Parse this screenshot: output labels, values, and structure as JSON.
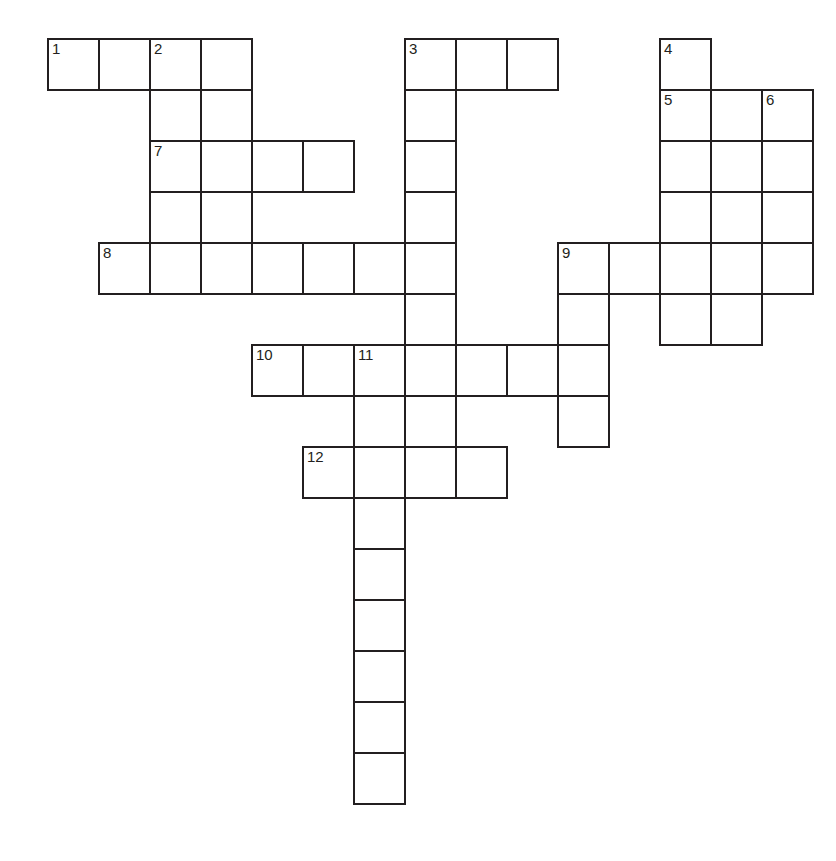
{
  "puzzle": {
    "kind": "crossword-grid",
    "title": "Crossword Puzzle Grid",
    "background_color": "#ffffff",
    "line_color": "#231f20",
    "cell_size": 51,
    "border_width": 2,
    "origin_x": 47,
    "origin_y": 38,
    "columns": 15,
    "rows": 15,
    "total_cells": 58,
    "number_count": 12
  },
  "numbers": [
    {
      "label": "1",
      "col": 0,
      "row": 0
    },
    {
      "label": "2",
      "col": 2,
      "row": 0
    },
    {
      "label": "3",
      "col": 7,
      "row": 0
    },
    {
      "label": "4",
      "col": 12,
      "row": 0
    },
    {
      "label": "5",
      "col": 12,
      "row": 1
    },
    {
      "label": "6",
      "col": 14,
      "row": 1
    },
    {
      "label": "7",
      "col": 2,
      "row": 2
    },
    {
      "label": "8",
      "col": 1,
      "row": 4
    },
    {
      "label": "9",
      "col": 10,
      "row": 4
    },
    {
      "label": "10",
      "col": 4,
      "row": 6
    },
    {
      "label": "11",
      "col": 6,
      "row": 6
    },
    {
      "label": "12",
      "col": 5,
      "row": 8
    }
  ],
  "cells": [
    {
      "col": 0,
      "row": 0,
      "num": "1"
    },
    {
      "col": 1,
      "row": 0,
      "num": ""
    },
    {
      "col": 2,
      "row": 0,
      "num": "2"
    },
    {
      "col": 3,
      "row": 0,
      "num": ""
    },
    {
      "col": 7,
      "row": 0,
      "num": "3"
    },
    {
      "col": 8,
      "row": 0,
      "num": ""
    },
    {
      "col": 9,
      "row": 0,
      "num": ""
    },
    {
      "col": 12,
      "row": 0,
      "num": "4"
    },
    {
      "col": 2,
      "row": 1,
      "num": ""
    },
    {
      "col": 3,
      "row": 1,
      "num": ""
    },
    {
      "col": 7,
      "row": 1,
      "num": ""
    },
    {
      "col": 12,
      "row": 1,
      "num": "5"
    },
    {
      "col": 13,
      "row": 1,
      "num": ""
    },
    {
      "col": 14,
      "row": 1,
      "num": "6"
    },
    {
      "col": 2,
      "row": 2,
      "num": "7"
    },
    {
      "col": 3,
      "row": 2,
      "num": ""
    },
    {
      "col": 4,
      "row": 2,
      "num": ""
    },
    {
      "col": 5,
      "row": 2,
      "num": ""
    },
    {
      "col": 7,
      "row": 2,
      "num": ""
    },
    {
      "col": 12,
      "row": 2,
      "num": ""
    },
    {
      "col": 13,
      "row": 2,
      "num": ""
    },
    {
      "col": 14,
      "row": 2,
      "num": ""
    },
    {
      "col": 2,
      "row": 3,
      "num": ""
    },
    {
      "col": 3,
      "row": 3,
      "num": ""
    },
    {
      "col": 7,
      "row": 3,
      "num": ""
    },
    {
      "col": 12,
      "row": 3,
      "num": ""
    },
    {
      "col": 13,
      "row": 3,
      "num": ""
    },
    {
      "col": 14,
      "row": 3,
      "num": ""
    },
    {
      "col": 1,
      "row": 4,
      "num": "8"
    },
    {
      "col": 2,
      "row": 4,
      "num": ""
    },
    {
      "col": 3,
      "row": 4,
      "num": ""
    },
    {
      "col": 4,
      "row": 4,
      "num": ""
    },
    {
      "col": 5,
      "row": 4,
      "num": ""
    },
    {
      "col": 6,
      "row": 4,
      "num": ""
    },
    {
      "col": 7,
      "row": 4,
      "num": ""
    },
    {
      "col": 10,
      "row": 4,
      "num": "9"
    },
    {
      "col": 11,
      "row": 4,
      "num": ""
    },
    {
      "col": 12,
      "row": 4,
      "num": ""
    },
    {
      "col": 13,
      "row": 4,
      "num": ""
    },
    {
      "col": 14,
      "row": 4,
      "num": ""
    },
    {
      "col": 7,
      "row": 5,
      "num": ""
    },
    {
      "col": 10,
      "row": 5,
      "num": ""
    },
    {
      "col": 12,
      "row": 5,
      "num": ""
    },
    {
      "col": 13,
      "row": 5,
      "num": ""
    },
    {
      "col": 4,
      "row": 6,
      "num": "10"
    },
    {
      "col": 5,
      "row": 6,
      "num": ""
    },
    {
      "col": 6,
      "row": 6,
      "num": "11"
    },
    {
      "col": 7,
      "row": 6,
      "num": ""
    },
    {
      "col": 8,
      "row": 6,
      "num": ""
    },
    {
      "col": 9,
      "row": 6,
      "num": ""
    },
    {
      "col": 10,
      "row": 6,
      "num": ""
    },
    {
      "col": 6,
      "row": 7,
      "num": ""
    },
    {
      "col": 7,
      "row": 7,
      "num": ""
    },
    {
      "col": 10,
      "row": 7,
      "num": ""
    },
    {
      "col": 5,
      "row": 8,
      "num": "12"
    },
    {
      "col": 6,
      "row": 8,
      "num": ""
    },
    {
      "col": 7,
      "row": 8,
      "num": ""
    },
    {
      "col": 8,
      "row": 8,
      "num": ""
    },
    {
      "col": 6,
      "row": 9,
      "num": ""
    },
    {
      "col": 6,
      "row": 10,
      "num": ""
    },
    {
      "col": 6,
      "row": 11,
      "num": ""
    },
    {
      "col": 6,
      "row": 12,
      "num": ""
    },
    {
      "col": 6,
      "row": 13,
      "num": ""
    },
    {
      "col": 6,
      "row": 14,
      "num": ""
    }
  ]
}
